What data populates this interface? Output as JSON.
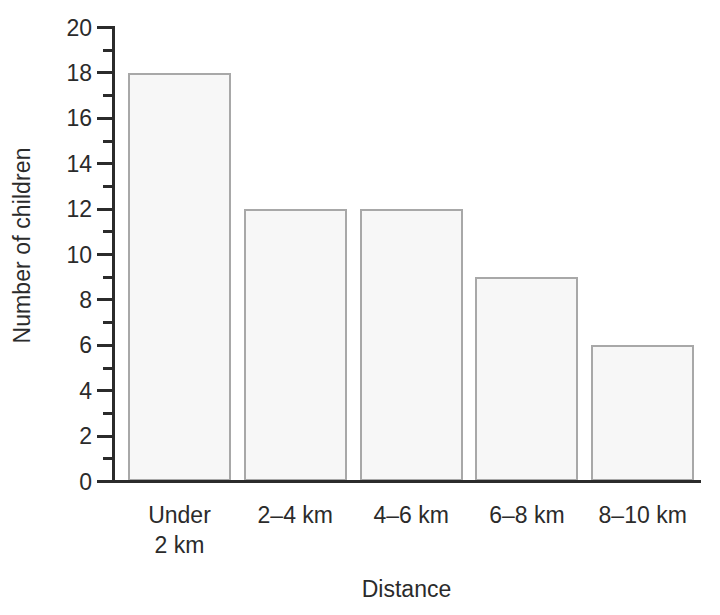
{
  "chart_data": {
    "type": "bar",
    "title": "",
    "subtitle": "",
    "xlabel": "Distance",
    "ylabel": "Number of children",
    "categories": [
      "Under\n2 km",
      "2–4 km",
      "4–6 km",
      "6–8 km",
      "8–10 km"
    ],
    "values": [
      18,
      12,
      12,
      9,
      6
    ],
    "ylim": [
      0,
      20
    ],
    "xlim": null,
    "y_major_ticks": [
      0,
      2,
      4,
      6,
      8,
      10,
      12,
      14,
      16,
      18,
      20
    ],
    "y_major_tick_labels": [
      "0",
      "2",
      "4",
      "6",
      "8",
      "10",
      "12",
      "14",
      "16",
      "18",
      "20"
    ],
    "y_minor_ticks": [
      1,
      3,
      5,
      7,
      9,
      11,
      13,
      15,
      17,
      19
    ],
    "grid": false,
    "legend": false,
    "legend_position": "none",
    "annotations": [],
    "colors": {
      "bar_fill": "#f7f7f7",
      "bar_border": "#a8a8a8",
      "axis": "#2b2b2b",
      "text": "#2b2b2b",
      "background": "#ffffff"
    }
  },
  "axes": {
    "y_title": "Number of children",
    "x_title": "Distance"
  }
}
